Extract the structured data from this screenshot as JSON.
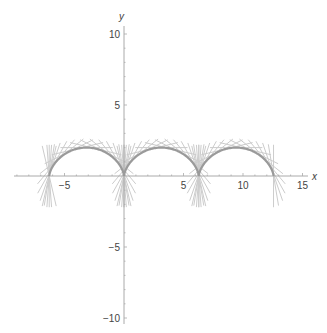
{
  "chart_data": {
    "type": "line",
    "title": "",
    "xlabel": "x",
    "ylabel": "y",
    "xlim": [
      -9.5,
      16.5
    ],
    "ylim": [
      -10.5,
      11
    ],
    "x_ticks": [
      -5,
      5,
      10,
      15
    ],
    "x_tick_labels": [
      "−5",
      "5",
      "10",
      "15"
    ],
    "y_ticks": [
      -10,
      -5,
      5,
      10
    ],
    "y_tick_labels": [
      "−10",
      "−5",
      "5",
      "10"
    ],
    "grid": false,
    "legend": null,
    "series": [
      {
        "name": "cycloid",
        "param_range": [
          -6.2832,
          12.5664
        ],
        "cusps_x": [
          -6.2832,
          0,
          6.2832,
          12.5664
        ],
        "arch_height": 2,
        "color": "#9a9a9a"
      },
      {
        "name": "tangent-lines",
        "count_per_arch": 16,
        "half_length": 2.2,
        "color": "#cccccc"
      }
    ]
  },
  "layout": {
    "origin_px": [
      124,
      176
    ],
    "scale_x_px_per_unit": 11.9,
    "scale_y_px_per_unit": 14.2,
    "x_axis_range_px": [
      14,
      308
    ],
    "y_axis_range_px": [
      26,
      324
    ],
    "axis_color": "#aaaaaa"
  }
}
